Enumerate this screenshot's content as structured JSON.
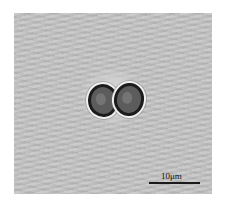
{
  "image": {
    "description": "Brightfield micrograph of a dividing cell pair (diplococcus-like) on grey background",
    "background_color": "#c4c4c4",
    "cell_outline_color": "#1c1c1c"
  },
  "scale_bar": {
    "label": "10μm",
    "color": "#1a1a1a"
  }
}
